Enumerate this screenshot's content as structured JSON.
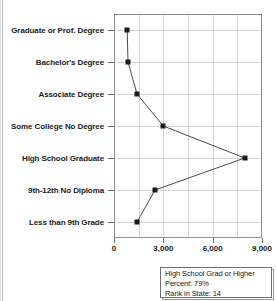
{
  "chart_data": {
    "type": "line",
    "orientation": "horizontal",
    "title": "",
    "subtitle": "",
    "xlabel": "",
    "ylabel": "",
    "xlim": [
      0,
      9000
    ],
    "ylim": null,
    "grid": true,
    "legend_position": "below-right",
    "x_ticks": [
      "0",
      "3,000",
      "6,000",
      "9,000"
    ],
    "x_tick_values": [
      0,
      3000,
      6000,
      9000
    ],
    "minor_gridline_values": [
      1500,
      3000,
      4500,
      6000,
      7500
    ],
    "categories": [
      "Graduate or Prof. Degree",
      "Bachelor's Degree",
      "Associate Degree",
      "Some College No Degree",
      "High School Graduate",
      "9th-12th No Diploma",
      "Less than 9th Grade"
    ],
    "values": [
      800,
      850,
      1400,
      3000,
      7950,
      2500,
      1400
    ],
    "series": [
      {
        "name": "Population by Educational Attainment",
        "values": [
          800,
          850,
          1400,
          3000,
          7950,
          2500,
          1400
        ]
      }
    ],
    "marker": "square",
    "marker_color": "#1a1a1a",
    "line_color": "#4a4a4a"
  },
  "infobox": {
    "title": "High School Grad or Higher",
    "percent_line": "Percent:  79%",
    "rank_line": "Rank in State:  14"
  },
  "colors": {
    "axis": "#8f8f8f",
    "grid": "#d4d4d4",
    "text": "#1b1b1b",
    "marker": "#1a1a1a",
    "line": "#4a4a4a",
    "background": "#ffffff"
  }
}
